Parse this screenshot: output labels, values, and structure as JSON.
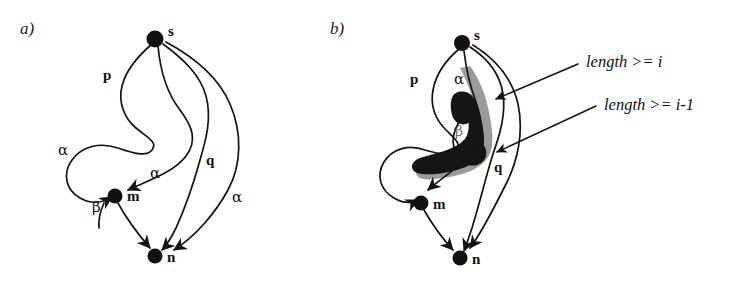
{
  "figure": {
    "width": 744,
    "height": 283,
    "background": "#ffffff",
    "ink_color": "#141414",
    "highlight_dark": "#151515",
    "highlight_gray": "#9a9a9a"
  },
  "panels": [
    {
      "tag": "a)",
      "nodes": [
        {
          "id": "s",
          "label": "s"
        },
        {
          "id": "m",
          "label": "m"
        },
        {
          "id": "n",
          "label": "n"
        }
      ],
      "edge_labels": [
        {
          "id": "p",
          "label": "p"
        },
        {
          "id": "q",
          "label": "q"
        },
        {
          "id": "alpha-left",
          "label": "α"
        },
        {
          "id": "alpha-mid",
          "label": "α"
        },
        {
          "id": "alpha-right",
          "label": "α"
        },
        {
          "id": "beta",
          "label": "β"
        }
      ]
    },
    {
      "tag": "b)",
      "nodes": [
        {
          "id": "s",
          "label": "s"
        },
        {
          "id": "m",
          "label": "m"
        },
        {
          "id": "n",
          "label": "n"
        }
      ],
      "edge_labels": [
        {
          "id": "p",
          "label": "p"
        },
        {
          "id": "q",
          "label": "q"
        },
        {
          "id": "alpha",
          "label": "α"
        },
        {
          "id": "beta",
          "label": "β"
        }
      ],
      "annotations": [
        {
          "id": "length-ge-i",
          "text": "length >= i"
        },
        {
          "id": "length-ge-i-minus-1",
          "text": "length >= i-1"
        }
      ]
    }
  ]
}
